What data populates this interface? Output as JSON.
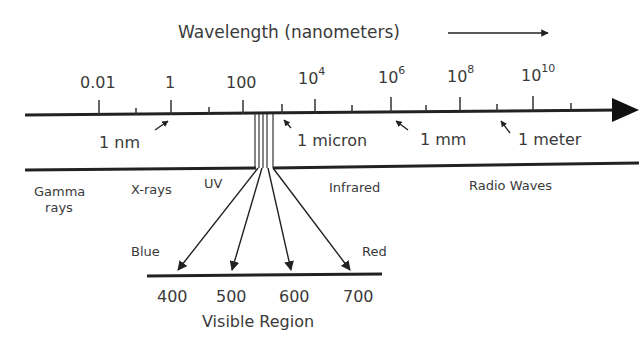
{
  "diagram": {
    "title": "Wavelength (nanometers)",
    "axis": {
      "ticks": [
        {
          "base": "0.01",
          "exp": ""
        },
        {
          "base": "1",
          "exp": ""
        },
        {
          "base": "100",
          "exp": ""
        },
        {
          "base": "10",
          "exp": "4"
        },
        {
          "base": "10",
          "exp": "6"
        },
        {
          "base": "10",
          "exp": "8"
        },
        {
          "base": "10",
          "exp": "10"
        }
      ],
      "markers": [
        "1 nm",
        "1 micron",
        "1 mm",
        "1 meter"
      ]
    },
    "regions": {
      "gamma_line1": "Gamma",
      "gamma_line2": "rays",
      "xrays": "X-rays",
      "uv": "UV",
      "infrared": "Infrared",
      "radio": "Radio Waves"
    },
    "visible": {
      "blue": "Blue",
      "red": "Red",
      "ticks": [
        "400",
        "500",
        "600",
        "700"
      ],
      "label": "Visible Region"
    },
    "colors": {
      "line": "#222222",
      "text": "#3a3a3a",
      "background": "#ffffff"
    }
  }
}
